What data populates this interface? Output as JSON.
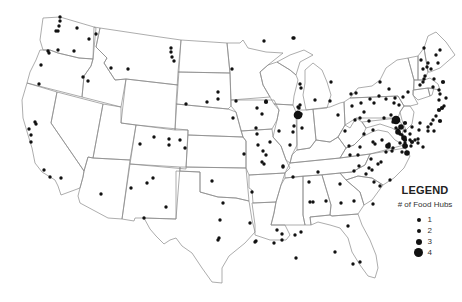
{
  "legend": {
    "title": "LEGEND",
    "subtitle": "# of Food Hubs",
    "items": [
      {
        "label": "1",
        "size": 3
      },
      {
        "label": "2",
        "size": 4
      },
      {
        "label": "3",
        "size": 6
      },
      {
        "label": "4",
        "size": 9
      }
    ]
  },
  "colors": {
    "dot": "#111111",
    "boundary": "#8a8a8a",
    "background": "#ffffff"
  },
  "hubs": [
    [
      60,
      17,
      1
    ],
    [
      60,
      21,
      1
    ],
    [
      59,
      26,
      1
    ],
    [
      58,
      31,
      1
    ],
    [
      56,
      31,
      1
    ],
    [
      77,
      28,
      1
    ],
    [
      89,
      39,
      1
    ],
    [
      96,
      34,
      1
    ],
    [
      74,
      51,
      1
    ],
    [
      58,
      50,
      1
    ],
    [
      48,
      51,
      1
    ],
    [
      49,
      53,
      1
    ],
    [
      41,
      65,
      1
    ],
    [
      111,
      68,
      1
    ],
    [
      128,
      69,
      1
    ],
    [
      83,
      77,
      1
    ],
    [
      88,
      81,
      1
    ],
    [
      39,
      84,
      1
    ],
    [
      35,
      122,
      1
    ],
    [
      36,
      124,
      1
    ],
    [
      29,
      129,
      1
    ],
    [
      31,
      135,
      1
    ],
    [
      31,
      142,
      1
    ],
    [
      44,
      170,
      1
    ],
    [
      50,
      177,
      1
    ],
    [
      61,
      178,
      1
    ],
    [
      101,
      194,
      1
    ],
    [
      140,
      144,
      1
    ],
    [
      153,
      178,
      1
    ],
    [
      147,
      183,
      1
    ],
    [
      144,
      218,
      1
    ],
    [
      131,
      188,
      1
    ],
    [
      166,
      207,
      1
    ],
    [
      171,
      48,
      1
    ],
    [
      171,
      52,
      1
    ],
    [
      172,
      57,
      1
    ],
    [
      174,
      61,
      1
    ],
    [
      186,
      104,
      1
    ],
    [
      154,
      137,
      1
    ],
    [
      169,
      139,
      1
    ],
    [
      169,
      145,
      1
    ],
    [
      180,
      140,
      1
    ],
    [
      185,
      148,
      1
    ],
    [
      207,
      102,
      1
    ],
    [
      218,
      92,
      1
    ],
    [
      218,
      99,
      1
    ],
    [
      232,
      69,
      1
    ],
    [
      233,
      118,
      1
    ],
    [
      236,
      101,
      1
    ],
    [
      264,
      41,
      1
    ],
    [
      257,
      108,
      1
    ],
    [
      262,
      114,
      1
    ],
    [
      256,
      128,
      1
    ],
    [
      262,
      162,
      1
    ],
    [
      270,
      142,
      1
    ],
    [
      212,
      181,
      1
    ],
    [
      223,
      203,
      1
    ],
    [
      220,
      220,
      1
    ],
    [
      219,
      238,
      1
    ],
    [
      218,
      240,
      1
    ],
    [
      244,
      154,
      1
    ],
    [
      252,
      192,
      1
    ],
    [
      257,
      134,
      1
    ],
    [
      266,
      155,
      1
    ],
    [
      293,
      38,
      1
    ],
    [
      294,
      38,
      1
    ],
    [
      266,
      101,
      1
    ],
    [
      279,
      131,
      1
    ],
    [
      294,
      126,
      1
    ],
    [
      293,
      132,
      1
    ],
    [
      298,
      107,
      1
    ],
    [
      299,
      108,
      1
    ],
    [
      301,
      114,
      1
    ],
    [
      302,
      128,
      1
    ],
    [
      258,
      145,
      1
    ],
    [
      263,
      151,
      1
    ],
    [
      290,
      145,
      1
    ],
    [
      283,
      166,
      1
    ],
    [
      309,
      182,
      1
    ],
    [
      318,
      172,
      1
    ],
    [
      310,
      202,
      1
    ],
    [
      313,
      202,
      1
    ],
    [
      293,
      177,
      1
    ],
    [
      264,
      164,
      1
    ],
    [
      283,
      167,
      1
    ],
    [
      256,
      241,
      1
    ],
    [
      250,
      223,
      1
    ],
    [
      255,
      242,
      1
    ],
    [
      274,
      243,
      1
    ],
    [
      296,
      258,
      1
    ],
    [
      277,
      230,
      1
    ],
    [
      301,
      232,
      1
    ],
    [
      295,
      235,
      1
    ],
    [
      282,
      234,
      1
    ],
    [
      282,
      240,
      1
    ],
    [
      335,
      252,
      1
    ],
    [
      353,
      264,
      1
    ],
    [
      360,
      262,
      1
    ],
    [
      348,
      226,
      1
    ],
    [
      359,
      166,
      1
    ],
    [
      369,
      168,
      1
    ],
    [
      366,
      174,
      1
    ],
    [
      373,
      204,
      1
    ],
    [
      354,
      201,
      1
    ],
    [
      340,
      184,
      1
    ],
    [
      341,
      203,
      1
    ],
    [
      326,
      201,
      1
    ],
    [
      373,
      130,
      1
    ],
    [
      382,
      140,
      1
    ],
    [
      358,
      155,
      1
    ],
    [
      350,
      155,
      1
    ],
    [
      354,
      171,
      1
    ],
    [
      372,
      170,
      1
    ],
    [
      374,
      182,
      1
    ],
    [
      380,
      186,
      1
    ],
    [
      390,
      180,
      1
    ],
    [
      360,
      147,
      1
    ],
    [
      375,
      144,
      1
    ],
    [
      386,
      152,
      1
    ],
    [
      300,
      84,
      1
    ],
    [
      315,
      100,
      1
    ],
    [
      300,
      105,
      1
    ],
    [
      301,
      88,
      1
    ],
    [
      331,
      82,
      1
    ],
    [
      351,
      94,
      1
    ],
    [
      356,
      93,
      1
    ],
    [
      370,
      99,
      1
    ],
    [
      379,
      96,
      1
    ],
    [
      380,
      82,
      1
    ],
    [
      386,
      99,
      1
    ],
    [
      394,
      103,
      1
    ],
    [
      330,
      101,
      1
    ],
    [
      338,
      115,
      1
    ],
    [
      345,
      131,
      1
    ],
    [
      355,
      120,
      1
    ],
    [
      352,
      106,
      1
    ],
    [
      361,
      103,
      1
    ],
    [
      369,
      121,
      1
    ],
    [
      360,
      118,
      1
    ],
    [
      364,
      112,
      1
    ],
    [
      373,
      142,
      1
    ],
    [
      374,
      103,
      1
    ],
    [
      389,
      89,
      1
    ],
    [
      395,
      98,
      1
    ],
    [
      399,
      105,
      1
    ],
    [
      408,
      92,
      1
    ],
    [
      420,
      85,
      1
    ],
    [
      423,
      82,
      1
    ],
    [
      424,
      79,
      1
    ],
    [
      425,
      76,
      1
    ],
    [
      428,
      63,
      1
    ],
    [
      431,
      69,
      1
    ],
    [
      434,
      79,
      1
    ],
    [
      433,
      87,
      1
    ],
    [
      439,
      90,
      1
    ],
    [
      440,
      94,
      1
    ],
    [
      439,
      100,
      1
    ],
    [
      446,
      98,
      1
    ],
    [
      444,
      106,
      1
    ],
    [
      436,
      116,
      1
    ],
    [
      433,
      120,
      1
    ],
    [
      431,
      124,
      1
    ],
    [
      428,
      127,
      1
    ],
    [
      428,
      131,
      1
    ],
    [
      434,
      131,
      1
    ],
    [
      438,
      63,
      1
    ],
    [
      440,
      50,
      1
    ],
    [
      436,
      55,
      1
    ],
    [
      423,
      69,
      1
    ],
    [
      427,
      67,
      1
    ],
    [
      424,
      48,
      1
    ],
    [
      421,
      60,
      1
    ],
    [
      403,
      97,
      1
    ],
    [
      384,
      118,
      1
    ],
    [
      391,
      115,
      1
    ],
    [
      393,
      122,
      1
    ],
    [
      396,
      128,
      1
    ],
    [
      398,
      130,
      1
    ],
    [
      400,
      134,
      1
    ],
    [
      402,
      135,
      1
    ],
    [
      405,
      131,
      1
    ],
    [
      410,
      134,
      1
    ],
    [
      405,
      143,
      1
    ],
    [
      406,
      146,
      1
    ],
    [
      402,
      152,
      1
    ],
    [
      410,
      140,
      1
    ],
    [
      412,
      127,
      1
    ],
    [
      420,
      123,
      1
    ],
    [
      418,
      139,
      1
    ],
    [
      415,
      140,
      1
    ],
    [
      418,
      143,
      1
    ],
    [
      423,
      147,
      1
    ],
    [
      411,
      146,
      1
    ],
    [
      400,
      143,
      1
    ],
    [
      393,
      148,
      1
    ],
    [
      381,
      162,
      1
    ],
    [
      378,
      164,
      1
    ],
    [
      371,
      159,
      1
    ],
    [
      389,
      144,
      1
    ],
    [
      364,
      134,
      1
    ],
    [
      349,
      146,
      1
    ],
    [
      419,
      130,
      1
    ],
    [
      392,
      151,
      1
    ],
    [
      439,
      110,
      2
    ],
    [
      442,
      108,
      2
    ],
    [
      440,
      121,
      2
    ],
    [
      443,
      82,
      2
    ],
    [
      412,
      142,
      2
    ],
    [
      405,
      123,
      2
    ],
    [
      405,
      140,
      2
    ],
    [
      266,
      102,
      2
    ],
    [
      404,
      138,
      3
    ],
    [
      401,
      127,
      3
    ],
    [
      398,
      132,
      3
    ],
    [
      407,
      153,
      3
    ],
    [
      405,
      146,
      3
    ],
    [
      388,
      146,
      3
    ],
    [
      298,
      115,
      4
    ],
    [
      396,
      120,
      4
    ]
  ]
}
